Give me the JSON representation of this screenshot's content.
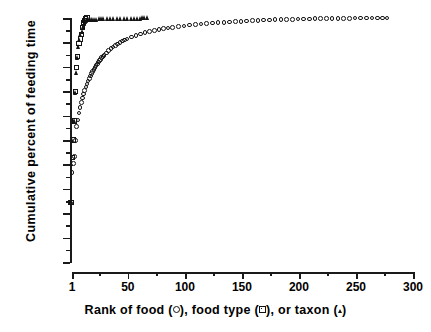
{
  "chart_data": {
    "type": "scatter",
    "title": "",
    "xlabel": "Rank of food (○),  food type (□),  or taxon (▴)",
    "ylabel": "Cumulative percent of feeding time",
    "xlim": [
      1,
      300
    ],
    "ylim": [
      0,
      100
    ],
    "grid": false,
    "legend_position": "in-axis-label",
    "xticks": [
      1,
      50,
      100,
      150,
      200,
      250,
      300
    ],
    "xtick_labels": [
      "1",
      "50",
      "100",
      "150",
      "200",
      "250",
      "300"
    ],
    "yticks": [
      0,
      10,
      20,
      30,
      40,
      50,
      60,
      70,
      80,
      90,
      100
    ],
    "ytick_labels": [
      "0",
      "10",
      "20",
      "30",
      "40",
      "50",
      "60",
      "70",
      "80",
      "90",
      "100"
    ],
    "series": [
      {
        "name": "Rank of food",
        "marker": "open-circle",
        "color": "#141414",
        "x": [
          1,
          2,
          3,
          4,
          5,
          6,
          7,
          8,
          9,
          10,
          11,
          12,
          13,
          14,
          15,
          16,
          17,
          18,
          19,
          20,
          21,
          22,
          23,
          24,
          25,
          26,
          27,
          28,
          29,
          30,
          32,
          34,
          36,
          38,
          40,
          42,
          44,
          46,
          48,
          50,
          54,
          58,
          62,
          66,
          70,
          74,
          78,
          82,
          86,
          90,
          95,
          100,
          105,
          110,
          115,
          120,
          125,
          130,
          135,
          140,
          145,
          150,
          155,
          160,
          165,
          170,
          175,
          180,
          185,
          190,
          195,
          200,
          205,
          210,
          215,
          220,
          225,
          230,
          235,
          240,
          245,
          250,
          255,
          260,
          265,
          270,
          274,
          278
        ],
        "y": [
          24.2,
          36.6,
          40.3,
          43.2,
          49.8,
          55.5,
          58.2,
          61.0,
          63.2,
          65.4,
          67.2,
          68.8,
          70.3,
          71.7,
          73.0,
          74.2,
          75.3,
          76.3,
          77.2,
          78.1,
          79.0,
          79.8,
          80.5,
          81.2,
          81.9,
          82.5,
          83.1,
          83.7,
          84.2,
          84.7,
          85.7,
          86.6,
          87.4,
          88.1,
          88.8,
          89.4,
          90.0,
          90.5,
          91.0,
          91.4,
          92.2,
          92.9,
          93.5,
          94.0,
          94.5,
          94.9,
          95.3,
          95.6,
          95.9,
          96.2,
          96.5,
          96.8,
          97.1,
          97.3,
          97.5,
          97.7,
          97.9,
          98.1,
          98.2,
          98.4,
          98.5,
          98.6,
          98.8,
          98.9,
          99.0,
          99.1,
          99.2,
          99.3,
          99.4,
          99.45,
          99.5,
          99.55,
          99.6,
          99.65,
          99.7,
          99.75,
          99.8,
          99.82,
          99.85,
          99.88,
          99.9,
          99.92,
          99.94,
          99.96,
          99.97,
          99.98,
          99.99,
          100.0
        ]
      },
      {
        "name": "Rank of food type",
        "marker": "open-square",
        "color": "#141414",
        "x": [
          1,
          2,
          3,
          4,
          5,
          6,
          7,
          8,
          9,
          10,
          11,
          12,
          13,
          14,
          15
        ],
        "y": [
          24.5,
          42.8,
          50.0,
          57.8,
          69.8,
          79.8,
          84.2,
          89.4,
          91.4,
          93.2,
          96.0,
          98.0,
          99.0,
          99.6,
          100.0
        ]
      },
      {
        "name": "Rank of taxon",
        "marker": "filled-triangle",
        "color": "#141414",
        "x": [
          1,
          2,
          3,
          4,
          5,
          6,
          7,
          8,
          9,
          10,
          11,
          12,
          13,
          14,
          15,
          16,
          17,
          18,
          19,
          20,
          22,
          24,
          26,
          28,
          30,
          33,
          36,
          39,
          42,
          45,
          48,
          51,
          54,
          57,
          60,
          62,
          64,
          66,
          68
        ],
        "y": [
          24.4,
          40.2,
          49.6,
          58.0,
          69.4,
          77.8,
          83.6,
          88.4,
          91.2,
          93.0,
          94.6,
          96.3,
          97.6,
          98.4,
          99.0,
          99.2,
          99.3,
          99.35,
          99.4,
          99.45,
          99.5,
          99.55,
          99.6,
          99.62,
          99.65,
          99.7,
          99.72,
          99.75,
          99.78,
          99.8,
          99.82,
          99.85,
          99.88,
          99.9,
          99.92,
          99.95,
          99.97,
          99.99,
          100.0
        ]
      }
    ]
  },
  "axis_label_parts": {
    "x_part1": "Rank of food (",
    "x_part2": "),  food type (",
    "x_part3": "),  or taxon (",
    "x_part4": ")"
  }
}
